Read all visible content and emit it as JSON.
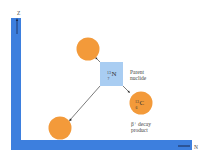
{
  "diagram": {
    "axes": {
      "y_label": "Z",
      "x_label": "N",
      "axis_color": "#3d7fde"
    },
    "parent": {
      "mass_number": "13",
      "atomic_number": "7",
      "symbol": "N",
      "label_line1": "Parent",
      "label_line2": "nuclide",
      "color": "#a9cdf2"
    },
    "daughter": {
      "mass_number": "13",
      "atomic_number": "6",
      "symbol": "C",
      "label_line1": "β⁺ decay",
      "label_line2": "product",
      "color": "#f39a3a"
    },
    "other_nuclides": [
      {
        "position": "upper-left",
        "color": "#f39a3a"
      },
      {
        "position": "lower-left",
        "color": "#f39a3a"
      }
    ]
  }
}
